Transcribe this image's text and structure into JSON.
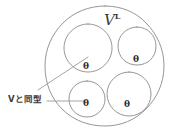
{
  "diagram": {
    "type": "hand-drawn-set-diagram",
    "outer_region": {
      "label_base": "V",
      "label_superscript": "L",
      "label_full": "V^L",
      "center_x": 105,
      "center_y": 66,
      "radius": 60
    },
    "inner_regions": [
      {
        "name": "top-left-circle",
        "label": "θ",
        "center_x": 88,
        "center_y": 48,
        "radius": 24,
        "label_x": 83,
        "label_y": 63
      },
      {
        "name": "top-right-circle",
        "label": "θ",
        "center_x": 137,
        "center_y": 46,
        "radius": 19,
        "label_x": 133,
        "label_y": 57
      },
      {
        "name": "bottom-left-circle",
        "label": "θ",
        "center_x": 87,
        "center_y": 99,
        "radius": 18,
        "label_x": 83,
        "label_y": 101
      },
      {
        "name": "bottom-right-circle",
        "label": "θ",
        "center_x": 129,
        "center_y": 94,
        "radius": 22,
        "label_x": 124,
        "label_y": 102
      }
    ],
    "annotation": {
      "text": "Vと同型",
      "meaning_label": "isomorphic-to-V",
      "x": 8,
      "y": 95
    },
    "leaders": [
      {
        "name": "diagonal-leader-line",
        "x1": 38,
        "y1": 90,
        "x2": 88,
        "y2": 57
      },
      {
        "name": "horizontal-leader-line",
        "x1": 47,
        "y1": 101,
        "x2": 86,
        "y2": 101
      }
    ],
    "colors": {
      "stroke": "#8a8a8a",
      "leader": "#9a9a9a",
      "text": "#3a3a3a",
      "background": "#ffffff"
    }
  }
}
